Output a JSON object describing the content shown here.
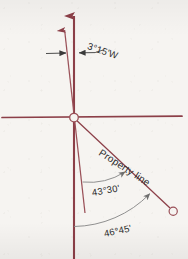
{
  "figure": {
    "type": "magnetic-declination-survey-diagram",
    "background_color": "#f6f4f1",
    "line_color": "#8c3f48",
    "arc_color": "#8a8a8a",
    "text_color": "#2b2b2b",
    "width": 188,
    "height": 259
  },
  "labels": {
    "declination": "3°15'W",
    "property_line": "Property line",
    "angle_upper": "43°30'",
    "angle_lower": "46°45'"
  },
  "icons": {
    "true_north_arrowhead": "arrow-up-icon",
    "magnetic_north_arrowhead": "arrow-up-icon",
    "origin_marker": "circle-outline-icon",
    "endpoint_marker": "circle-outline-icon",
    "dimension_arrow_left": "arrow-right-icon",
    "dimension_arrow_right": "arrow-left-icon",
    "arc_tick_upper": "arrow-tick-icon",
    "arc_tick_lower": "arrow-tick-icon"
  },
  "geometry": {
    "origin": {
      "x": 74,
      "y": 118
    },
    "true_north_line": {
      "x1": 74,
      "y1": 14,
      "x2": 74,
      "y2": 259
    },
    "magnetic_north_line": {
      "x1": 65,
      "y1": 28,
      "x2": 85,
      "y2": 213
    },
    "horizontal_line": {
      "x1": 2,
      "y1": 117,
      "x2": 182,
      "y2": 116
    },
    "property_line": {
      "x1": 74,
      "y1": 118,
      "x2": 171,
      "y2": 209
    },
    "endpoint": {
      "x": 173,
      "y": 211,
      "r": 4
    },
    "declination_degrees": 3.25,
    "angle_upper_degrees": 43.5,
    "angle_lower_degrees": 46.75
  }
}
